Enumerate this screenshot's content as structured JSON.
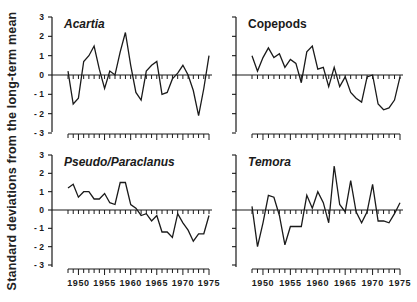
{
  "figure": {
    "ylabel": "Standard deviations from the long-term mean"
  },
  "chart_data": [
    {
      "type": "line",
      "title": "Acartia",
      "title_style": "italic",
      "panel": "top-left",
      "xlabel": "",
      "ylabel": "Standard deviations from the long-term mean",
      "ylim": [
        -3,
        3
      ],
      "yticks": [
        3,
        2,
        1,
        0,
        -1,
        -2,
        -3
      ],
      "xlim": [
        1948,
        1975
      ],
      "xticks": [],
      "x": [
        1948,
        1949,
        1950,
        1951,
        1952,
        1953,
        1954,
        1955,
        1956,
        1957,
        1958,
        1959,
        1960,
        1961,
        1962,
        1963,
        1964,
        1965,
        1966,
        1967,
        1968,
        1969,
        1970,
        1971,
        1972,
        1973,
        1974,
        1975
      ],
      "values": [
        0.2,
        -1.5,
        -1.2,
        0.7,
        1.0,
        1.5,
        0.3,
        -0.7,
        0.2,
        0.0,
        1.2,
        2.2,
        0.5,
        -0.9,
        -1.3,
        0.2,
        0.5,
        0.7,
        -1.0,
        -0.9,
        -0.2,
        0.1,
        0.5,
        0.0,
        -0.8,
        -2.1,
        -0.7,
        1.0
      ],
      "grid": false
    },
    {
      "type": "line",
      "title": "Copepods",
      "title_style": "normal",
      "panel": "top-right",
      "ylim": [
        -3,
        3
      ],
      "xlim": [
        1948,
        1975
      ],
      "x": [
        1948,
        1949,
        1950,
        1951,
        1952,
        1953,
        1954,
        1955,
        1956,
        1957,
        1958,
        1959,
        1960,
        1961,
        1962,
        1963,
        1964,
        1965,
        1966,
        1967,
        1968,
        1969,
        1970,
        1971,
        1972,
        1973,
        1974,
        1975
      ],
      "values": [
        1.0,
        0.2,
        0.9,
        1.4,
        0.9,
        1.1,
        0.4,
        0.8,
        0.6,
        -0.4,
        1.2,
        1.5,
        0.3,
        0.4,
        -0.6,
        0.4,
        -0.6,
        -0.1,
        -0.9,
        -1.2,
        -1.4,
        -0.1,
        0.0,
        -1.5,
        -1.8,
        -1.7,
        -1.3,
        -0.1
      ],
      "grid": false
    },
    {
      "type": "line",
      "title": "Pseudo / Paracalanus",
      "title_display": "Pseudo/Paraclanus",
      "title_style": "italic",
      "panel": "bottom-left",
      "ylim": [
        -3,
        3
      ],
      "yticks": [
        3,
        2,
        1,
        0,
        -1,
        -2,
        -3
      ],
      "xlim": [
        1948,
        1975
      ],
      "xticks": [
        1950,
        1955,
        1960,
        1965,
        1970,
        1975
      ],
      "x": [
        1948,
        1949,
        1950,
        1951,
        1952,
        1953,
        1954,
        1955,
        1956,
        1957,
        1958,
        1959,
        1960,
        1961,
        1962,
        1963,
        1964,
        1965,
        1966,
        1967,
        1968,
        1969,
        1970,
        1971,
        1972,
        1973,
        1974,
        1975
      ],
      "values": [
        1.2,
        1.4,
        0.7,
        1.0,
        1.0,
        0.6,
        0.6,
        0.9,
        0.4,
        0.3,
        1.5,
        1.5,
        0.3,
        0.1,
        -0.3,
        -0.2,
        -0.6,
        -0.3,
        -1.2,
        -1.2,
        -1.5,
        -0.2,
        -0.7,
        -1.1,
        -1.7,
        -1.3,
        -1.3,
        -0.3
      ],
      "grid": false
    },
    {
      "type": "line",
      "title": "Temora",
      "title_style": "italic",
      "panel": "bottom-right",
      "ylim": [
        -3,
        3
      ],
      "xlim": [
        1948,
        1975
      ],
      "xticks": [
        1950,
        1955,
        1960,
        1965,
        1970,
        1975
      ],
      "x": [
        1948,
        1949,
        1950,
        1951,
        1952,
        1953,
        1954,
        1955,
        1956,
        1957,
        1958,
        1959,
        1960,
        1961,
        1962,
        1963,
        1964,
        1965,
        1966,
        1967,
        1968,
        1969,
        1970,
        1971,
        1972,
        1973,
        1974,
        1975
      ],
      "values": [
        0.2,
        -2.0,
        -0.7,
        0.8,
        0.7,
        -0.3,
        -1.9,
        -0.9,
        -0.9,
        -0.9,
        0.8,
        0.1,
        1.0,
        0.4,
        -0.7,
        2.4,
        0.3,
        -0.1,
        1.6,
        -0.1,
        -0.7,
        -0.1,
        1.4,
        -0.6,
        -0.6,
        -0.7,
        -0.2,
        0.4
      ],
      "grid": false
    }
  ],
  "axes": {
    "yticks": [
      "3",
      "2",
      "1",
      "0",
      "-1",
      "-2",
      "-3"
    ],
    "xtick_labels": [
      "1950",
      "1955",
      "1960",
      "1965",
      "1970",
      "1975"
    ]
  }
}
